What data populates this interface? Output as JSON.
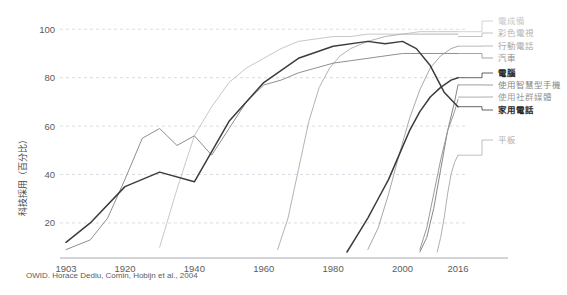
{
  "chart_data": {
    "type": "line",
    "title": "",
    "subtitle": "",
    "xlabel": "",
    "ylabel": "科技採用（百分比）",
    "xlim": [
      1903,
      2016
    ],
    "ylim": [
      8,
      103
    ],
    "grid": true,
    "legend_position": "right",
    "source_note": "OWID. Horace Dediu, Comin, Hobijn et al., 2004",
    "x_ticks": [
      "1903",
      "1920",
      "1940",
      "1960",
      "1980",
      "2000",
      "2016"
    ],
    "x_tick_values": [
      1903,
      1920,
      1940,
      1960,
      1980,
      2000,
      2016
    ],
    "y_ticks": [
      "20",
      "40",
      "60",
      "80",
      "100"
    ],
    "y_tick_values": [
      20,
      40,
      60,
      80,
      100
    ],
    "series": [
      {
        "name": "電成備",
        "label": "電成備",
        "color": "#c8c8c8",
        "bold": false,
        "legend_y": 21,
        "anchor_x": 2016,
        "anchor_y": 99,
        "x": [
          1930,
          1935,
          1940,
          1945,
          1950,
          1955,
          1960,
          1965,
          1970,
          1975,
          1980,
          1985,
          1990,
          1995,
          2000,
          2005,
          2010,
          2016
        ],
        "y": [
          10,
          34,
          56,
          68,
          78,
          84,
          88,
          92,
          95,
          96,
          97,
          97,
          98,
          98,
          98,
          99,
          99,
          99
        ]
      },
      {
        "name": "彩色電視",
        "label": "彩色電視",
        "color": "#b4b4b4",
        "bold": false,
        "legend_y": 33,
        "anchor_x": 2016,
        "anchor_y": 97,
        "x": [
          1964,
          1967,
          1970,
          1973,
          1976,
          1979,
          1982,
          1985,
          1990,
          1995,
          2000,
          2005,
          2010,
          2016
        ],
        "y": [
          9,
          22,
          42,
          62,
          76,
          84,
          89,
          92,
          95,
          97,
          98,
          98,
          98,
          98
        ]
      },
      {
        "name": "行動電話",
        "label": "行動電話",
        "color": "#a8a8a8",
        "bold": false,
        "legend_y": 46,
        "anchor_x": 2016,
        "anchor_y": 93,
        "x": [
          1990,
          1993,
          1996,
          1999,
          2002,
          2005,
          2008,
          2011,
          2014,
          2016
        ],
        "y": [
          9,
          18,
          32,
          48,
          63,
          75,
          84,
          89,
          92,
          93
        ]
      },
      {
        "name": "汽車",
        "label": "汽車",
        "color": "#8f8f8f",
        "bold": false,
        "legend_y": 58,
        "anchor_x": 2016,
        "anchor_y": 90,
        "x": [
          1903,
          1910,
          1915,
          1920,
          1925,
          1930,
          1935,
          1940,
          1945,
          1950,
          1955,
          1960,
          1965,
          1970,
          1975,
          1980,
          1985,
          1990,
          1995,
          2000,
          2005,
          2010,
          2016
        ],
        "y": [
          9,
          13,
          22,
          38,
          55,
          59,
          52,
          56,
          48,
          59,
          70,
          77,
          79,
          82,
          84,
          86,
          87,
          88,
          89,
          90,
          90,
          90,
          90
        ]
      },
      {
        "name": "電腦",
        "label": "電腦",
        "color": "#3c3c3c",
        "bold": true,
        "legend_y": 73,
        "anchor_x": 2016,
        "anchor_y": 80,
        "x": [
          1984,
          1987,
          1990,
          1993,
          1996,
          1999,
          2002,
          2005,
          2008,
          2011,
          2014,
          2016
        ],
        "y": [
          8,
          15,
          22,
          30,
          38,
          48,
          58,
          66,
          72,
          76,
          79,
          80
        ]
      },
      {
        "name": "使用智慧型手機",
        "label": "使用智慧型手機",
        "color": "#878787",
        "bold": false,
        "legend_y": 85,
        "anchor_x": 2016,
        "anchor_y": 77,
        "x": [
          2005,
          2007,
          2009,
          2011,
          2013,
          2015,
          2016
        ],
        "y": [
          8,
          14,
          26,
          42,
          58,
          70,
          77
        ]
      },
      {
        "name": "使用社群媒體",
        "label": "使用社群媒體",
        "color": "#9a9a9a",
        "bold": false,
        "legend_y": 97,
        "anchor_x": 2016,
        "anchor_y": 72,
        "x": [
          2005,
          2007,
          2009,
          2011,
          2013,
          2015,
          2016
        ],
        "y": [
          9,
          18,
          32,
          46,
          58,
          66,
          71
        ]
      },
      {
        "name": "家用電話",
        "label": "家用電話",
        "color": "#3c3c3c",
        "bold": true,
        "legend_y": 110,
        "anchor_x": 2016,
        "anchor_y": 68,
        "x": [
          1903,
          1910,
          1920,
          1930,
          1940,
          1950,
          1960,
          1970,
          1980,
          1990,
          1995,
          2000,
          2004,
          2008,
          2012,
          2016
        ],
        "y": [
          12,
          20,
          35,
          41,
          37,
          62,
          78,
          88,
          93,
          95,
          94,
          95,
          92,
          85,
          74,
          68
        ]
      },
      {
        "name": "平板",
        "label": "平板",
        "color": "#b0b0b0",
        "bold": false,
        "legend_y": 140,
        "anchor_x": 2016,
        "anchor_y": 48,
        "x": [
          2010,
          2011,
          2012,
          2013,
          2014,
          2015,
          2016
        ],
        "y": [
          8,
          14,
          22,
          32,
          40,
          45,
          48
        ]
      }
    ]
  }
}
